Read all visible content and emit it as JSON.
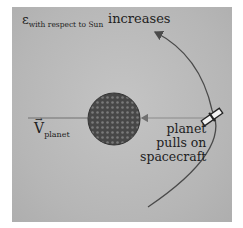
{
  "diagram": {
    "title_symbol": "ε",
    "title_subscript": "with respect to Sun",
    "title_suffix": "increases",
    "velocity_label_symbol": "V",
    "velocity_label_arrow": "⃗",
    "velocity_label_subscript": "planet",
    "force_label_lines": [
      "planet",
      "pulls on",
      "spacecraft"
    ],
    "nodes": [
      {
        "id": "planet",
        "label": "planet",
        "shape": "circle",
        "cx": 114,
        "cy": 119,
        "r": 26,
        "fill": "#4a4a4a"
      },
      {
        "id": "spacecraft",
        "label": "spacecraft",
        "shape": "satellite-icon",
        "x": 212,
        "y": 117
      }
    ],
    "edges": [
      {
        "id": "trajectory",
        "type": "arc",
        "from": [
          148,
          207
        ],
        "to": [
          155,
          32
        ],
        "arrowhead": "end",
        "color": "#4a4a4a"
      },
      {
        "id": "velocity-line",
        "type": "line",
        "from": [
          28,
          118
        ],
        "to": [
          88,
          118
        ],
        "color": "#707070"
      },
      {
        "id": "pull-arrow",
        "type": "arrow",
        "from": [
          205,
          118
        ],
        "to": [
          141,
          118
        ],
        "color": "#707070"
      }
    ],
    "colors": {
      "panel_bg": "#b9b9b9",
      "page_bg": "#ffffff",
      "planet": "#4a4a4a",
      "text": "#1e1e1e"
    }
  }
}
